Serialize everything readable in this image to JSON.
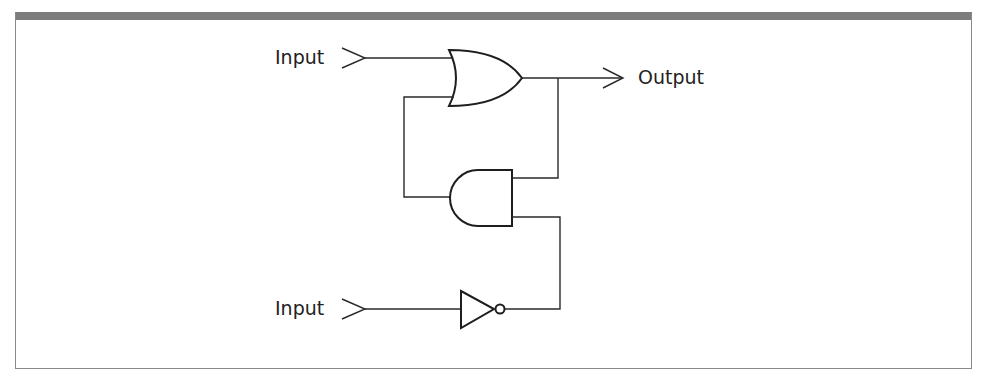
{
  "diagram": {
    "type": "logic-circuit",
    "labels": {
      "input_top": "Input",
      "input_bottom": "Input",
      "output": "Output"
    },
    "components": [
      {
        "id": "or-gate",
        "kind": "OR",
        "inputs": [
          "input_top",
          "and-gate.out"
        ],
        "output": "output"
      },
      {
        "id": "and-gate",
        "kind": "AND",
        "inputs": [
          "or-gate.out (feedback)",
          "not-gate.out"
        ],
        "output": "or-gate.in2"
      },
      {
        "id": "not-gate",
        "kind": "NOT",
        "inputs": [
          "input_bottom"
        ],
        "output": "and-gate.in2"
      }
    ],
    "colors": {
      "frame_bar": "#7d7d7d",
      "stroke": "#1e1e1e",
      "background": "#ffffff"
    }
  }
}
